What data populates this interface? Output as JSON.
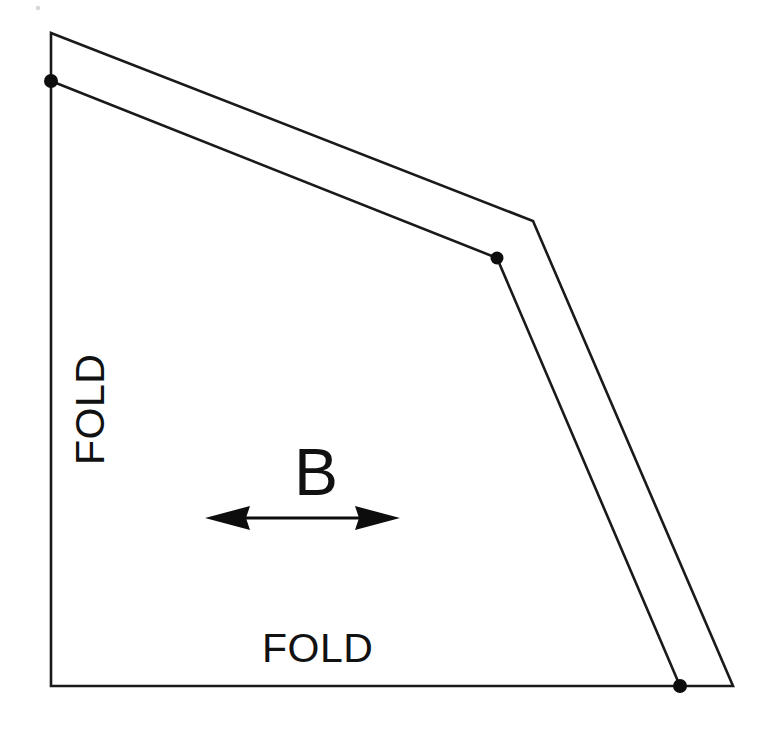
{
  "figure": {
    "type": "fold-pattern-diagram",
    "background_color": "#ffffff",
    "line_color": "#1a1a1a",
    "canvas": {
      "width": 770,
      "height": 732
    }
  },
  "labels": {
    "fold_vertical": "FOLD",
    "fold_horizontal": "FOLD",
    "panel_b": "B"
  },
  "chart_data": {
    "type": "line",
    "title": "",
    "xlabel": "",
    "ylabel": "",
    "grid": false,
    "legend": "none",
    "xlim": [
      0,
      770
    ],
    "ylim": [
      732,
      0
    ],
    "annotations": [
      {
        "text": "FOLD",
        "x": 95,
        "y": 412,
        "rotation": -90
      },
      {
        "text": "FOLD",
        "x": 312,
        "y": 644,
        "rotation": 0
      },
      {
        "text": "B",
        "x": 313,
        "y": 468,
        "rotation": 0
      }
    ],
    "series": [
      {
        "name": "outer-outline",
        "closed": true,
        "points": [
          [
            51,
            33
          ],
          [
            533,
            221
          ],
          [
            733,
            686
          ],
          [
            51,
            686
          ]
        ]
      },
      {
        "name": "inner-crease",
        "closed": false,
        "points": [
          [
            51,
            81
          ],
          [
            497,
            258
          ],
          [
            680,
            686
          ]
        ]
      }
    ],
    "markers": [
      {
        "name": "crease-start-dot",
        "x": 51,
        "y": 81,
        "r": 7
      },
      {
        "name": "crease-vertex-dot",
        "x": 497,
        "y": 258,
        "r": 6.5
      },
      {
        "name": "crease-end-dot",
        "x": 680,
        "y": 686,
        "r": 7
      }
    ],
    "arrow": {
      "name": "panel-b-width-arrow",
      "double_headed": true,
      "x_start": 205,
      "x_end": 400,
      "y": 518
    }
  }
}
